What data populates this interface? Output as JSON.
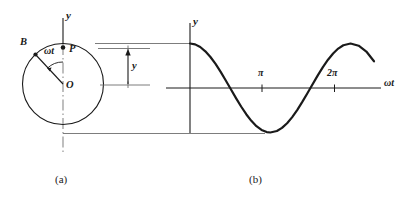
{
  "figure": {
    "title_text": "",
    "panels": [
      {
        "id": "a",
        "caption": "(a)",
        "kind": "reference-circle",
        "labels": {
          "vertical_axis": "y",
          "point_on_circle": "B",
          "projection_point": "P",
          "center": "O",
          "angle": "ωt",
          "displacement": "y"
        }
      },
      {
        "id": "b",
        "caption": "(b)",
        "kind": "sine-curve",
        "labels": {
          "vertical_axis": "y",
          "horizontal_axis": "ωt",
          "tick_pi": "π",
          "tick_two_pi": "2π"
        }
      }
    ]
  },
  "chart_data": {
    "type": "line",
    "title": "",
    "xlabel": "ωt",
    "ylabel": "y",
    "xlim": [
      0,
      7.4
    ],
    "ylim": [
      -1.15,
      1.15
    ],
    "grid": false,
    "legend": null,
    "tick_labels_x": [
      "π",
      "2π"
    ],
    "tick_values_x": [
      3.14159,
      6.28319
    ],
    "tick_labels_y": [],
    "annotations": [
      {
        "text": "horizontal projector from circle top to curve start",
        "y": 1.0
      },
      {
        "text": "horizontal projector from circle bottom to curve minimum",
        "y": -1.0
      }
    ],
    "series": [
      {
        "name": "y = A cos(ωt)",
        "x": [
          0,
          0.2,
          0.4,
          0.6,
          0.8,
          1.0,
          1.2,
          1.4,
          1.5708,
          1.8,
          2.0,
          2.2,
          2.4,
          2.6,
          2.8,
          3.0,
          3.14159,
          3.4,
          3.6,
          3.8,
          4.0,
          4.2,
          4.4,
          4.6,
          4.7124,
          5.0,
          5.2,
          5.4,
          5.6,
          5.8,
          6.0,
          6.28319,
          6.6,
          6.9,
          7.2,
          7.4
        ],
        "y": [
          1.0,
          0.98,
          0.921,
          0.825,
          0.697,
          0.54,
          0.362,
          0.17,
          0.0,
          -0.227,
          -0.416,
          -0.589,
          -0.737,
          -0.857,
          -0.942,
          -0.99,
          -1.0,
          -0.967,
          -0.897,
          -0.791,
          -0.654,
          -0.49,
          -0.307,
          -0.112,
          0.0,
          0.284,
          0.469,
          0.635,
          0.776,
          0.886,
          0.96,
          1.0,
          0.95,
          0.82,
          0.6,
          0.45
        ]
      }
    ]
  },
  "circle_data": {
    "type": "reference-circle",
    "center_label": "O",
    "radius_point_label": "B",
    "projection_label": "P",
    "angle_label": "ωt",
    "angle_degrees": 115,
    "displacement_label": "y",
    "vertical_axis_label": "y"
  }
}
